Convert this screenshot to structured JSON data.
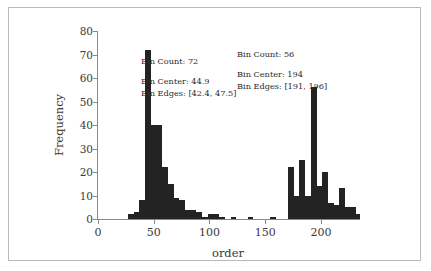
{
  "chart_data": {
    "type": "bar",
    "title": "",
    "subtitle": "",
    "xlabel": "order",
    "ylabel": "Frequency",
    "xlim": [
      0,
      235
    ],
    "ylim": [
      0,
      80
    ],
    "grid": false,
    "legend": null,
    "xticks": [
      0,
      50,
      100,
      150,
      200
    ],
    "yticks": [
      0,
      10,
      20,
      30,
      40,
      50,
      60,
      70,
      80
    ],
    "bin_width": 5.1,
    "bar_color": "#232323",
    "bins": [
      {
        "center": 29.6,
        "edges": [
          27.0,
          32.1
        ],
        "value": 2
      },
      {
        "center": 34.7,
        "edges": [
          32.1,
          37.2
        ],
        "value": 3
      },
      {
        "center": 39.8,
        "edges": [
          37.2,
          42.4
        ],
        "value": 8
      },
      {
        "center": 44.9,
        "edges": [
          42.4,
          47.5
        ],
        "value": 72
      },
      {
        "center": 50.0,
        "edges": [
          47.5,
          52.6
        ],
        "value": 40
      },
      {
        "center": 55.1,
        "edges": [
          52.6,
          57.7
        ],
        "value": 40
      },
      {
        "center": 60.2,
        "edges": [
          57.7,
          62.8
        ],
        "value": 22
      },
      {
        "center": 65.3,
        "edges": [
          62.8,
          67.9
        ],
        "value": 15
      },
      {
        "center": 70.4,
        "edges": [
          67.9,
          73.0
        ],
        "value": 9
      },
      {
        "center": 75.5,
        "edges": [
          73.0,
          78.1
        ],
        "value": 8
      },
      {
        "center": 80.6,
        "edges": [
          78.1,
          83.2
        ],
        "value": 4
      },
      {
        "center": 85.7,
        "edges": [
          83.2,
          88.3
        ],
        "value": 4
      },
      {
        "center": 90.8,
        "edges": [
          88.3,
          93.4
        ],
        "value": 3
      },
      {
        "center": 95.9,
        "edges": [
          93.4,
          98.5
        ],
        "value": 1
      },
      {
        "center": 101.0,
        "edges": [
          98.5,
          103.6
        ],
        "value": 2
      },
      {
        "center": 106.1,
        "edges": [
          103.6,
          108.7
        ],
        "value": 2
      },
      {
        "center": 111.2,
        "edges": [
          108.7,
          113.8
        ],
        "value": 1
      },
      {
        "center": 116.3,
        "edges": [
          113.8,
          118.9
        ],
        "value": 0
      },
      {
        "center": 121.4,
        "edges": [
          118.9,
          124.0
        ],
        "value": 1
      },
      {
        "center": 126.5,
        "edges": [
          124.0,
          129.1
        ],
        "value": 0
      },
      {
        "center": 131.6,
        "edges": [
          129.1,
          134.2
        ],
        "value": 0
      },
      {
        "center": 136.7,
        "edges": [
          134.2,
          139.3
        ],
        "value": 1
      },
      {
        "center": 141.8,
        "edges": [
          139.3,
          144.4
        ],
        "value": 0
      },
      {
        "center": 146.9,
        "edges": [
          144.4,
          149.5
        ],
        "value": 0
      },
      {
        "center": 152.0,
        "edges": [
          149.5,
          154.6
        ],
        "value": 0
      },
      {
        "center": 157.1,
        "edges": [
          154.6,
          159.7
        ],
        "value": 1
      },
      {
        "center": 162.2,
        "edges": [
          159.7,
          164.8
        ],
        "value": 0
      },
      {
        "center": 167.3,
        "edges": [
          164.8,
          169.9
        ],
        "value": 0
      },
      {
        "center": 173.0,
        "edges": [
          170.4,
          175.5
        ],
        "value": 22
      },
      {
        "center": 178.1,
        "edges": [
          175.5,
          180.6
        ],
        "value": 10
      },
      {
        "center": 183.2,
        "edges": [
          180.6,
          185.7
        ],
        "value": 25
      },
      {
        "center": 188.3,
        "edges": [
          185.7,
          190.8
        ],
        "value": 10
      },
      {
        "center": 194.0,
        "edges": [
          191.0,
          196.0
        ],
        "value": 56
      },
      {
        "center": 199.0,
        "edges": [
          196.0,
          201.1
        ],
        "value": 14
      },
      {
        "center": 204.1,
        "edges": [
          201.1,
          206.2
        ],
        "value": 20
      },
      {
        "center": 209.2,
        "edges": [
          206.2,
          211.3
        ],
        "value": 7
      },
      {
        "center": 214.3,
        "edges": [
          211.3,
          216.4
        ],
        "value": 6
      },
      {
        "center": 219.4,
        "edges": [
          216.4,
          221.5
        ],
        "value": 13
      },
      {
        "center": 224.5,
        "edges": [
          221.5,
          226.6
        ],
        "value": 5
      },
      {
        "center": 229.6,
        "edges": [
          226.6,
          231.7
        ],
        "value": 5
      },
      {
        "center": 234.0,
        "edges": [
          231.7,
          236.0
        ],
        "value": 2
      }
    ],
    "annotations": [
      {
        "id": "left",
        "count_label": "Bin Count: 72",
        "center_label": "Bin Center: 44.9",
        "edges_label": "Bin Edges: [42.4, 47.5]",
        "target_bin_center": 44.9,
        "target_bin_value": 72
      },
      {
        "id": "right",
        "count_label": "Bin Count: 56",
        "center_label": "Bin Center: 194",
        "edges_label": "Bin Edges: [191, 196]",
        "target_bin_center": 194,
        "target_bin_value": 56
      }
    ]
  },
  "annotations": {
    "left": {
      "count": "Bin Count: 72",
      "center": "Bin Center: 44.9",
      "edges": "Bin Edges: [42.4, 47.5]"
    },
    "right": {
      "count": "Bin Count: 56",
      "center": "Bin Center: 194",
      "edges": "Bin Edges: [191, 196]"
    }
  }
}
